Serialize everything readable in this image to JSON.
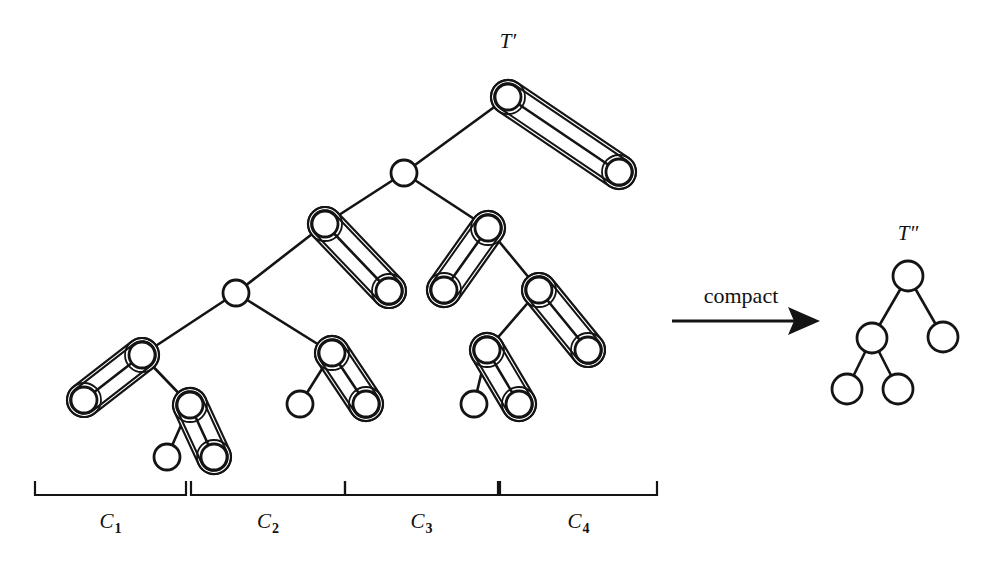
{
  "figure": {
    "title_left": "T′",
    "title_right": "T″",
    "operation_label": "compact",
    "background_color": "#ffffff",
    "ink_color": "#141414"
  },
  "clusters": [
    {
      "name": "C",
      "subscript": "1",
      "x_start": 35,
      "x_end": 186
    },
    {
      "name": "C",
      "subscript": "2",
      "x_start": 191,
      "x_end": 345
    },
    {
      "name": "C",
      "subscript": "3",
      "x_start": 345,
      "x_end": 498
    },
    {
      "name": "C",
      "subscript": "4",
      "x_start": 500,
      "x_end": 657
    }
  ],
  "tree_left": {
    "label": "T′",
    "label_x": 508,
    "label_y": 48,
    "nodes": [
      {
        "id": "r",
        "x": 508,
        "y": 97,
        "fill": "hatched",
        "outlined": true
      },
      {
        "id": "r_r",
        "x": 619,
        "y": 172,
        "fill": "white",
        "outlined": true
      },
      {
        "id": "a",
        "x": 404,
        "y": 173,
        "fill": "hatched",
        "outlined": false
      },
      {
        "id": "b",
        "x": 325,
        "y": 224,
        "fill": "hatched",
        "outlined": true
      },
      {
        "id": "b_r",
        "x": 389,
        "y": 291,
        "fill": "white",
        "outlined": true
      },
      {
        "id": "c",
        "x": 236,
        "y": 293,
        "fill": "hatched",
        "outlined": false
      },
      {
        "id": "d",
        "x": 142,
        "y": 355,
        "fill": "hatched",
        "outlined": true
      },
      {
        "id": "d_l",
        "x": 84,
        "y": 400,
        "fill": "white",
        "outlined": true
      },
      {
        "id": "e",
        "x": 190,
        "y": 405,
        "fill": "hatched",
        "outlined": true
      },
      {
        "id": "e_l",
        "x": 167,
        "y": 457,
        "fill": "white",
        "outlined": false
      },
      {
        "id": "e_r",
        "x": 214,
        "y": 457,
        "fill": "white",
        "outlined": true
      },
      {
        "id": "f",
        "x": 332,
        "y": 353,
        "fill": "hatched",
        "outlined": true
      },
      {
        "id": "f_l",
        "x": 300,
        "y": 404,
        "fill": "white",
        "outlined": false
      },
      {
        "id": "f_r",
        "x": 366,
        "y": 404,
        "fill": "white",
        "outlined": true
      },
      {
        "id": "g",
        "x": 488,
        "y": 228,
        "fill": "hatched",
        "outlined": true
      },
      {
        "id": "g_l",
        "x": 444,
        "y": 290,
        "fill": "white",
        "outlined": true
      },
      {
        "id": "h",
        "x": 539,
        "y": 290,
        "fill": "hatched",
        "outlined": true
      },
      {
        "id": "h_r",
        "x": 588,
        "y": 350,
        "fill": "white",
        "outlined": true
      },
      {
        "id": "i",
        "x": 487,
        "y": 350,
        "fill": "hatched",
        "outlined": true
      },
      {
        "id": "i_l",
        "x": 474,
        "y": 404,
        "fill": "white",
        "outlined": false
      },
      {
        "id": "i_r",
        "x": 519,
        "y": 404,
        "fill": "white",
        "outlined": true
      }
    ],
    "plain_edges": [
      [
        "r",
        "a"
      ],
      [
        "a",
        "b"
      ],
      [
        "a",
        "g"
      ],
      [
        "b",
        "c"
      ],
      [
        "c",
        "d"
      ],
      [
        "c",
        "f"
      ],
      [
        "d",
        "e"
      ],
      [
        "e",
        "e_l"
      ],
      [
        "f",
        "f_l"
      ],
      [
        "g",
        "h"
      ],
      [
        "h",
        "i"
      ],
      [
        "i",
        "i_l"
      ]
    ],
    "capsule_edges": [
      [
        "r",
        "r_r"
      ],
      [
        "b",
        "b_r"
      ],
      [
        "d",
        "d_l"
      ],
      [
        "e",
        "e_r"
      ],
      [
        "f",
        "f_r"
      ],
      [
        "g",
        "g_l"
      ],
      [
        "h",
        "h_r"
      ],
      [
        "i",
        "i_r"
      ]
    ]
  },
  "tree_right": {
    "label": "T″",
    "label_x": 908,
    "label_y": 240,
    "nodes": [
      {
        "id": "R",
        "x": 908,
        "y": 276,
        "fill": "hatched"
      },
      {
        "id": "L",
        "x": 872,
        "y": 338,
        "fill": "hatched"
      },
      {
        "id": "RR",
        "x": 943,
        "y": 337,
        "fill": "white"
      },
      {
        "id": "LL",
        "x": 847,
        "y": 389,
        "fill": "white"
      },
      {
        "id": "LR",
        "x": 898,
        "y": 389,
        "fill": "white"
      }
    ],
    "edges": [
      [
        "R",
        "L"
      ],
      [
        "R",
        "RR"
      ],
      [
        "L",
        "LL"
      ],
      [
        "L",
        "LR"
      ]
    ]
  },
  "arrow": {
    "label": "compact",
    "label_x": 741,
    "label_y": 303,
    "x_start": 672,
    "x_end": 814,
    "y": 321
  }
}
